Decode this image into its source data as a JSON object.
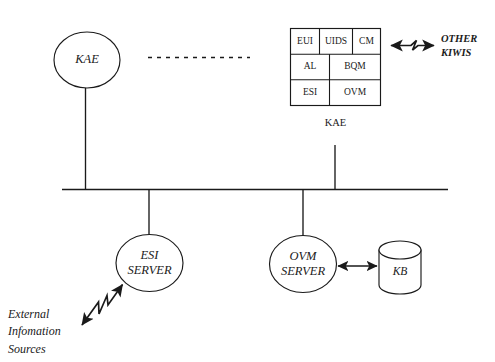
{
  "diagram": {
    "background_color": "#ffffff",
    "line_color": "#1a1a1a",
    "nodes": {
      "kae_left": {
        "label": "KAE",
        "shape": "ellipse"
      },
      "kae_right": {
        "label": "KAE",
        "shape": "circle",
        "modules": [
          {
            "id": "eui",
            "label": "EUI",
            "row": 1,
            "col": 1
          },
          {
            "id": "uids",
            "label": "UIDS",
            "row": 1,
            "col": 2
          },
          {
            "id": "cm",
            "label": "CM",
            "row": 1,
            "col": 3
          },
          {
            "id": "al",
            "label": "AL",
            "row": 2,
            "col": 1
          },
          {
            "id": "bqm",
            "label": "BQM",
            "row": 2,
            "col": 2
          },
          {
            "id": "esi",
            "label": "ESI",
            "row": 3,
            "col": 1
          },
          {
            "id": "ovm",
            "label": "OVM",
            "row": 3,
            "col": 2
          }
        ]
      },
      "esi_server": {
        "label_line1": "ESI",
        "label_line2": "SERVER",
        "shape": "ellipse"
      },
      "ovm_server": {
        "label_line1": "OVM",
        "label_line2": "SERVER",
        "shape": "ellipse"
      },
      "kb": {
        "label": "KB",
        "shape": "cylinder"
      }
    },
    "annotations": {
      "other_kiwis_line1": "OTHER",
      "other_kiwis_line2": "KIWIS",
      "external_line1": "External",
      "external_line2": "Infomation",
      "external_line3": "Sources"
    },
    "connections": {
      "bus_label": "network-bus",
      "dashed_label": "ellipsis-dashed-link",
      "kae_to_other_kiwis": "bidirectional-zigzag",
      "ovm_to_kb": "bidirectional-straight",
      "external_to_esi": "bidirectional-zigzag"
    }
  }
}
